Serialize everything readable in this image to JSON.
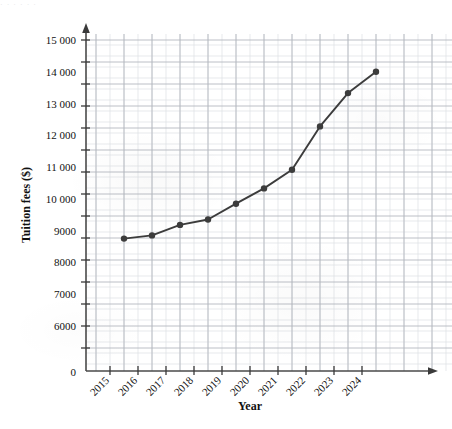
{
  "chart_data": {
    "type": "line",
    "title": "",
    "xlabel": "Year",
    "ylabel": "Tuition fees ($)",
    "categories": [
      "2015",
      "2016",
      "2017",
      "2018",
      "2019",
      "2020",
      "2021",
      "2022",
      "2023",
      "2024"
    ],
    "values": [
      8750,
      8850,
      9180,
      9350,
      9850,
      10330,
      10920,
      12280,
      13330,
      14000
    ],
    "series": [
      {
        "name": "Tuition fees",
        "values": [
          8750,
          8850,
          9180,
          9350,
          9850,
          10330,
          10920,
          12280,
          13330,
          14000
        ]
      }
    ],
    "ylim": [
      0,
      15500
    ],
    "ytick_labels": [
      "6000",
      "7000",
      "8000",
      "9000",
      "10 000",
      "11 000",
      "12 000",
      "13 000",
      "14 000",
      "15 000"
    ],
    "ytick_values": [
      6000,
      7000,
      8000,
      9000,
      10000,
      11000,
      12000,
      13000,
      14000,
      15000
    ],
    "origin_label": "0",
    "grid": true,
    "grid_minor": true,
    "legend": "none",
    "marker": "filled-circle",
    "line_color": "#3c3c3c",
    "marker_color": "#3c3c3c",
    "grid_major_color": "#b8bcc4",
    "grid_minor_color": "#d8dbe0",
    "axis_color": "#4a4a4a",
    "axis_break_y": true,
    "xtick_rotation": -45,
    "top_artifact_text": "·  ·   ·      ·        ·   ·"
  }
}
